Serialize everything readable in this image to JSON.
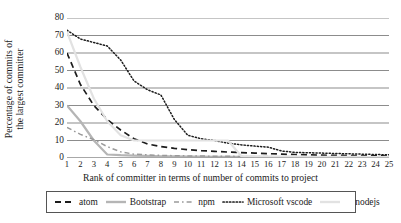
{
  "chart_data": {
    "type": "line",
    "title": "",
    "xlabel": "Rank of committer in terms of number of commits to project",
    "ylabel_line1": "Percentage of commits of",
    "ylabel_line2": "the largest committer",
    "x": [
      1,
      2,
      3,
      4,
      5,
      6,
      7,
      8,
      9,
      10,
      11,
      12,
      13,
      14,
      15,
      16,
      17,
      18,
      19,
      20,
      21,
      22,
      23,
      24,
      25
    ],
    "xtick_labels": [
      "1",
      "2",
      "3",
      "4",
      "5",
      "6",
      "7",
      "8",
      "9",
      "10",
      "11",
      "12",
      "13",
      "14",
      "15",
      "16",
      "17",
      "18",
      "19",
      "20",
      "21",
      "22",
      "23",
      "24",
      "25"
    ],
    "ytick_labels": [
      "0",
      "10",
      "20",
      "30",
      "40",
      "50",
      "60",
      "70",
      "80"
    ],
    "yticks": [
      0,
      10,
      20,
      30,
      40,
      50,
      60,
      70,
      80
    ],
    "ylim": [
      0,
      80
    ],
    "xlim": [
      1,
      25
    ],
    "grid": "horizontal",
    "legend_position": "bottom",
    "series": [
      {
        "name": "atom",
        "style": "dashed",
        "color": "#1c1c1c",
        "values": [
          60,
          42,
          30,
          22,
          16,
          11,
          8,
          6.5,
          5.5,
          4.8,
          4.2,
          3.8,
          3.4,
          3.1,
          2.8,
          2.5,
          2.2,
          2.0,
          1.8,
          1.6,
          1.5,
          1.4,
          1.3,
          1.2,
          1.1
        ]
      },
      {
        "name": "Bootstrap",
        "style": "solid",
        "color": "#b5b5b5",
        "values": [
          30,
          21,
          10,
          2,
          1.6,
          1.4,
          1.2,
          1.0,
          0.9,
          0.8,
          0.75,
          0.7,
          0.65,
          0.6,
          0.55,
          0.5,
          0.48,
          0.45,
          0.42,
          0.4,
          0.38,
          0.36,
          0.34,
          0.32,
          0.3
        ]
      },
      {
        "name": "npm",
        "style": "dash-dot",
        "color": "#9a9a9a",
        "values": [
          17.5,
          13.5,
          10.5,
          6.5,
          3.5,
          2.2,
          1.8,
          1.5,
          1.3,
          1.2,
          1.1,
          1.0,
          0.95,
          0.9,
          0.85,
          0.8,
          0.75,
          0.7,
          0.68,
          0.65,
          0.62,
          0.6,
          0.58,
          0.55,
          0.52
        ]
      },
      {
        "name": "Microsoft vscode",
        "style": "dotted",
        "color": "#1c1c1c",
        "values": [
          73,
          68,
          66,
          64,
          56,
          44,
          39,
          36,
          22,
          13,
          11,
          10,
          8.5,
          7.5,
          6.8,
          6.2,
          4.0,
          3.2,
          3.0,
          2.8,
          2.6,
          2.4,
          2.2,
          2.0,
          1.8
        ]
      },
      {
        "name": "nodejs",
        "style": "solid-faint",
        "color": "#e2e2e2",
        "values": [
          72,
          52,
          34,
          21,
          13,
          10,
          10,
          10,
          10,
          10,
          10,
          10,
          10,
          1.0,
          0.9,
          0.85,
          0.8,
          0.75,
          0.7,
          0.68,
          0.65,
          0.62,
          0.6,
          0.58,
          0.55
        ]
      }
    ]
  },
  "legend": {
    "items": [
      {
        "label": "atom",
        "icon": "dashed-line-swatch"
      },
      {
        "label": "Bootstrap",
        "icon": "solid-gray-line-swatch"
      },
      {
        "label": "npm",
        "icon": "dash-dot-line-swatch"
      },
      {
        "label": "Microsoft vscode",
        "icon": "dotted-line-swatch"
      },
      {
        "label": "nodejs",
        "icon": "faint-line-swatch"
      }
    ]
  },
  "colors": {
    "gridline": "#8c8c8c",
    "axis_text": "#1a1a1a",
    "legend_border": "#555555",
    "background": "#ffffff"
  }
}
